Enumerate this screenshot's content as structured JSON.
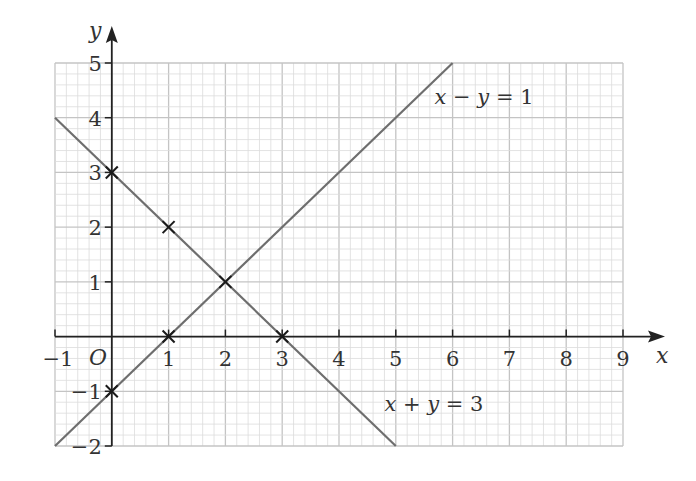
{
  "chart_data": {
    "type": "line",
    "title": "",
    "xlabel": "x",
    "ylabel": "y",
    "origin_label": "O",
    "xlim": [
      -1,
      9
    ],
    "ylim": [
      -2,
      5
    ],
    "grid": true,
    "minor_divisions_per_unit": 5,
    "x_ticks": [
      -1,
      1,
      2,
      3,
      4,
      5,
      6,
      7,
      8,
      9
    ],
    "y_ticks": [
      -2,
      -1,
      1,
      2,
      3,
      4,
      5
    ],
    "x_tick_labels": [
      "−1",
      "1",
      "2",
      "3",
      "4",
      "5",
      "6",
      "7",
      "8",
      "9"
    ],
    "y_tick_labels": [
      "−2",
      "−1",
      "1",
      "2",
      "3",
      "4",
      "5"
    ],
    "series": [
      {
        "name": "x − y = 1",
        "label_parts": [
          "x",
          " − ",
          "y",
          " = 1"
        ],
        "x": [
          -1,
          6
        ],
        "y": [
          -2,
          5
        ],
        "marked_points": [
          [
            0,
            -1
          ],
          [
            1,
            0
          ],
          [
            2,
            1
          ]
        ]
      },
      {
        "name": "x + y = 3",
        "label_parts": [
          "x",
          " + ",
          "y",
          " = 3"
        ],
        "x": [
          -1,
          5
        ],
        "y": [
          4,
          -2
        ],
        "marked_points": [
          [
            0,
            3
          ],
          [
            1,
            2
          ],
          [
            2,
            1
          ],
          [
            3,
            0
          ]
        ]
      }
    ],
    "annotations": [
      {
        "text": "x − y = 1",
        "x": 5.7,
        "y": 4.3
      },
      {
        "text": "x + y = 3",
        "x": 4.8,
        "y": -1.3
      }
    ],
    "colors": {
      "line": "#6e6e6e",
      "axis": "#222222",
      "grid_major": "#c4c4c4",
      "grid_minor": "#dcdcdc",
      "marker": "#1a1a1a"
    }
  }
}
